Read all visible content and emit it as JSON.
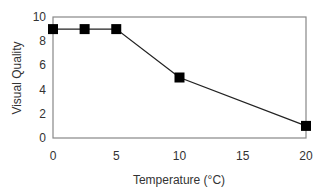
{
  "chart_data": {
    "type": "line",
    "title": "",
    "xlabel": "Temperature (°C)",
    "ylabel": "Visual Quality",
    "x": [
      0,
      2.5,
      5,
      10,
      20
    ],
    "series": [
      {
        "name": "Visual Quality",
        "values": [
          9,
          9,
          9,
          5,
          1
        ],
        "marker": "square",
        "color": "#000000"
      }
    ],
    "xlim": [
      0,
      20
    ],
    "ylim": [
      0,
      10
    ],
    "xticks": [
      0,
      5,
      10,
      15,
      20
    ],
    "yticks": [
      0,
      2,
      4,
      6,
      8,
      10
    ],
    "grid": false,
    "legend": null
  },
  "colors": {
    "frame": "#888888",
    "line": "#222222",
    "marker": "#000000",
    "text": "#333333"
  }
}
